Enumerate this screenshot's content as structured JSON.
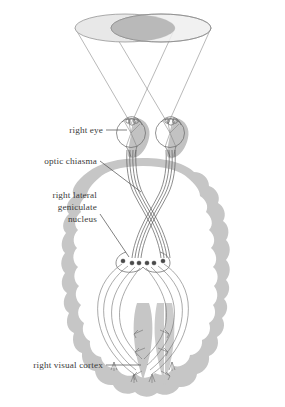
{
  "figure": {
    "background_color": "#ffffff",
    "ink_color": "#3b3b3b",
    "brain_fill": "#c6c6c6",
    "shadow_fill": "#c2c2c2",
    "field_left_fill": "#e8e8e8",
    "field_right_fill": "#efefef",
    "field_overlap_fill": "#b9b9b9"
  },
  "labels": [
    {
      "id": "right-eye",
      "lines": [
        "right eye"
      ],
      "text": "right eye",
      "align": "right",
      "x": 103,
      "y": 133,
      "leader": "M106,130 L128,130"
    },
    {
      "id": "optic-chiasma",
      "lines": [
        "optic chiasma"
      ],
      "text": "optic chiasma",
      "align": "right",
      "x": 97,
      "y": 164,
      "leader": "M100,161 L141,177"
    },
    {
      "id": "right-lateral-geniculate-nucleus",
      "lines": [
        "right lateral",
        "geniculate",
        "nucleus"
      ],
      "text": "right lateral geniculate nucleus",
      "align": "right",
      "x": 97,
      "y": 198,
      "line_height": 12,
      "leader": "M100,213 L131,256"
    },
    {
      "id": "right-visual-cortex",
      "lines": [
        "right visual cortex"
      ],
      "text": "right visual cortex",
      "align": "right",
      "x": 103,
      "y": 368,
      "leader": "M106,365 L159,365"
    }
  ],
  "structures": {
    "visual_field_left": "left visual field cone",
    "visual_field_right": "right visual field cone",
    "visual_field_overlap": "binocular overlap region",
    "left_eye": "left eye",
    "right_eye": "right eye",
    "optic_nerve_left": "left optic nerve",
    "optic_nerve_right": "right optic nerve",
    "optic_chiasma": "optic chiasma",
    "optic_tract_left": "left optic tract",
    "optic_tract_right": "right optic tract",
    "lgn_left": "left lateral geniculate nucleus",
    "lgn_right": "right lateral geniculate nucleus",
    "optic_radiation_left": "left optic radiation",
    "optic_radiation_right": "right optic radiation",
    "visual_cortex_left": "left visual cortex",
    "visual_cortex_right": "right visual cortex",
    "brain_outline": "cerebral cortex outline"
  },
  "counts": {
    "lgn_nodes_per_side": 3,
    "fibers_per_tract": 4,
    "cortex_terminals_per_side": 3
  }
}
